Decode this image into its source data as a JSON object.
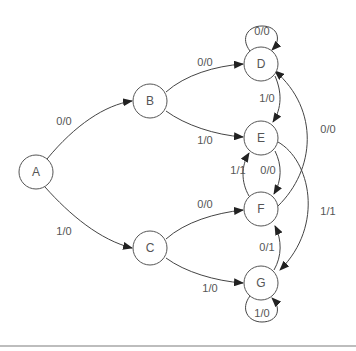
{
  "diagram": {
    "type": "state-machine",
    "nodes": [
      {
        "id": "A",
        "label": "A"
      },
      {
        "id": "B",
        "label": "B"
      },
      {
        "id": "C",
        "label": "C"
      },
      {
        "id": "D",
        "label": "D"
      },
      {
        "id": "E",
        "label": "E"
      },
      {
        "id": "F",
        "label": "F"
      },
      {
        "id": "G",
        "label": "G"
      }
    ],
    "edges": [
      {
        "from": "A",
        "to": "B",
        "label": "0/0"
      },
      {
        "from": "A",
        "to": "C",
        "label": "1/0"
      },
      {
        "from": "B",
        "to": "D",
        "label": "0/0"
      },
      {
        "from": "B",
        "to": "E",
        "label": "1/0"
      },
      {
        "from": "C",
        "to": "F",
        "label": "0/0"
      },
      {
        "from": "C",
        "to": "G",
        "label": "1/0"
      },
      {
        "from": "D",
        "to": "D",
        "label": "0/0"
      },
      {
        "from": "D",
        "to": "E",
        "label": "1/0"
      },
      {
        "from": "E",
        "to": "F",
        "label": "0/0"
      },
      {
        "from": "E",
        "to": "G",
        "label": "1/1"
      },
      {
        "from": "F",
        "to": "E",
        "label": "1/1"
      },
      {
        "from": "F",
        "to": "D",
        "label": "0/0"
      },
      {
        "from": "G",
        "to": "F",
        "label": "0/1"
      },
      {
        "from": "G",
        "to": "G",
        "label": "1/0"
      }
    ]
  }
}
